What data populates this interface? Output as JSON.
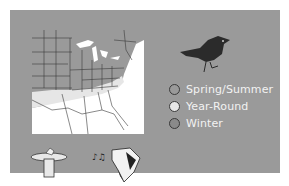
{
  "range_map": {
    "title": "Range map",
    "colors": {
      "panel": "#9a9a9a",
      "spring_summer": "#9a9a9a",
      "year_round": "#e6e6e6",
      "winter": "#8a8a8a",
      "map_background": "#ffffff",
      "state_borders": "#3a3a3a"
    }
  },
  "legend": {
    "items": [
      {
        "label": "Spring/Summer",
        "color": "#9a9a9a"
      },
      {
        "label": "Year-Round",
        "color": "#e6e6e6"
      },
      {
        "label": "Winter",
        "color": "#8a8a8a"
      }
    ]
  },
  "icons": {
    "bird": "bird-silhouette-icon",
    "birdbath": "birdbath-icon",
    "song": "music-notes-icon",
    "woodpecker": "woodpecker-head-icon"
  }
}
